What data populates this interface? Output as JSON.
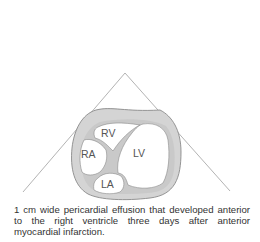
{
  "figure": {
    "labels": {
      "rv": "RV",
      "ra": "RA",
      "lv": "LV",
      "la": "LA"
    },
    "colors": {
      "effusion": "#d2d2d2",
      "chamber": "#ffffff",
      "outline": "#8a8a8a",
      "sector": "#9a9a9a"
    }
  },
  "caption": {
    "text": "1 cm wide pericardial effusion that developed anterior to the right ventricle three days after anterior myocardial infarction."
  }
}
